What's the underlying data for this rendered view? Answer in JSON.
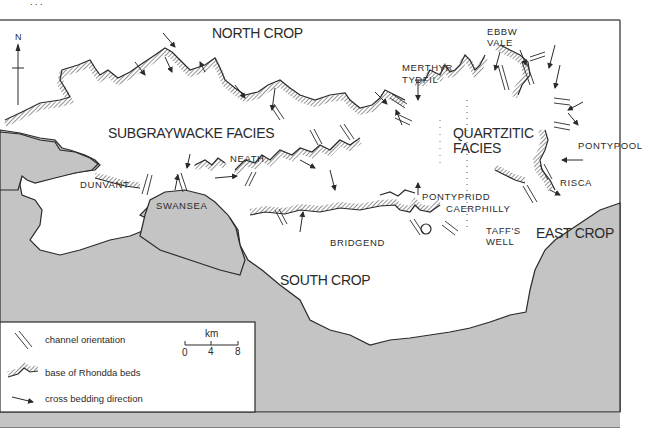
{
  "map": {
    "title_fragment": ". . .",
    "north_arrow": {
      "label": "N"
    },
    "regions": {
      "north_crop": "NORTH CROP",
      "south_crop": "SOUTH CROP",
      "east_crop": "EAST CROP",
      "subgraywacke": "SUBGRAYWACKE FACIES",
      "quartzitic_line1": "QUARTZITIC",
      "quartzitic_line2": "FACIES"
    },
    "towns": {
      "dunvant": "DUNVANT",
      "swansea": "SWANSEA",
      "neath": "NEATH",
      "bridgend": "BRIDGEND",
      "merthyr_line1": "MERTHYR",
      "merthyr_line2": "TYDFIL",
      "ebbw_line1": "EBBW",
      "ebbw_line2": "VALE",
      "pontypool": "PONTYPOOL",
      "risca": "RISCA",
      "pontypridd": "PONTYPRIDD",
      "caerphilly": "CAERPHILLY",
      "taffs_line1": "TAFF'S",
      "taffs_line2": "WELL"
    },
    "colors": {
      "sea": "#c4c4c4",
      "land": "#ffffff",
      "line": "#2a2a2a",
      "frame": "#555555"
    }
  },
  "legend": {
    "items": [
      {
        "symbol": "channel-orientation-icon",
        "label": "channel orientation"
      },
      {
        "symbol": "rhondda-base-icon",
        "label": "base of Rhondda beds"
      },
      {
        "symbol": "cross-bedding-arrow-icon",
        "label": "cross bedding direction"
      }
    ],
    "scale": {
      "unit": "km",
      "ticks": [
        "0",
        "4",
        "8"
      ]
    }
  }
}
